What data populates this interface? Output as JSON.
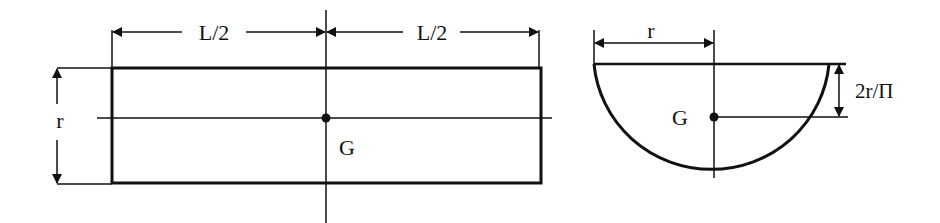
{
  "diagram": {
    "type": "engineering-figure",
    "colors": {
      "line": "#111111",
      "background": "#ffffff"
    },
    "left_figure": {
      "description": "Rectangular cross-section (side view) of half-cylinder with centroid",
      "dimension_top_left": "L/2",
      "dimension_top_right": "L/2",
      "dimension_left": "r",
      "centroid_label": "G"
    },
    "right_figure": {
      "description": "Semicircular end view with centroid",
      "dimension_top": "r",
      "dimension_right": "2r/Π",
      "centroid_label": "G"
    }
  }
}
